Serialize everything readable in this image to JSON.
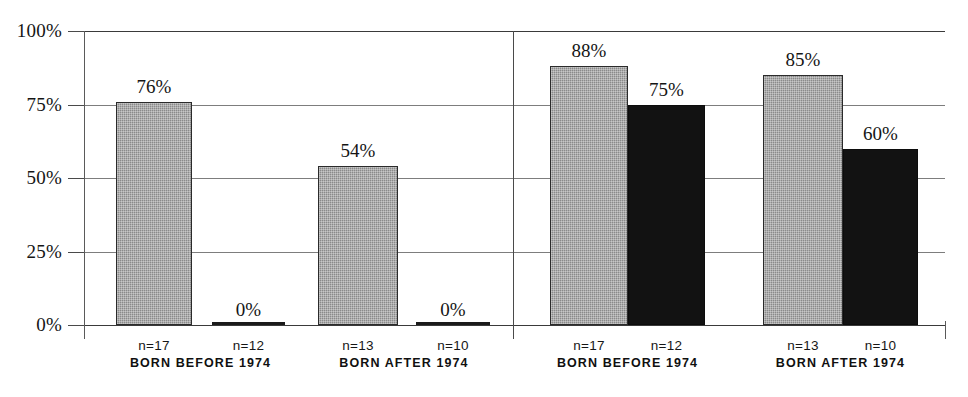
{
  "chart_data": {
    "type": "bar",
    "title": "",
    "subtitle": "",
    "xlabel": "",
    "ylabel": "",
    "ylim": [
      0,
      100
    ],
    "grid": true,
    "legend": "none",
    "y_ticks": [
      {
        "value": 100,
        "label": "100%"
      },
      {
        "value": 75,
        "label": "75%"
      },
      {
        "value": 50,
        "label": "50%"
      },
      {
        "value": 25,
        "label": "25%"
      },
      {
        "value": 0,
        "label": "0%"
      }
    ],
    "panels": [
      {
        "name": "left-panel",
        "groups": [
          {
            "label": "BORN BEFORE 1974",
            "bars": [
              {
                "series": "gray",
                "value": 76,
                "value_label": "76%",
                "n_label": "n=17"
              },
              {
                "series": "black",
                "value": 0,
                "value_label": "0%",
                "n_label": "n=12"
              }
            ]
          },
          {
            "label": "BORN AFTER 1974",
            "bars": [
              {
                "series": "gray",
                "value": 54,
                "value_label": "54%",
                "n_label": "n=13"
              },
              {
                "series": "black",
                "value": 0,
                "value_label": "0%",
                "n_label": "n=10"
              }
            ]
          }
        ]
      },
      {
        "name": "right-panel",
        "groups": [
          {
            "label": "BORN BEFORE 1974",
            "bars": [
              {
                "series": "gray",
                "value": 88,
                "value_label": "88%",
                "n_label": "n=17"
              },
              {
                "series": "black",
                "value": 75,
                "value_label": "75%",
                "n_label": "n=12"
              }
            ]
          },
          {
            "label": "BORN AFTER 1974",
            "bars": [
              {
                "series": "gray",
                "value": 85,
                "value_label": "85%",
                "n_label": "n=13"
              },
              {
                "series": "black",
                "value": 60,
                "value_label": "60%",
                "n_label": "n=10"
              }
            ]
          }
        ]
      }
    ],
    "colors": {
      "gray_series": "#8a8a8a",
      "black_series": "#121212",
      "gridline": "#7d7d7d",
      "axis": "#3a3a3a",
      "text": "#151515",
      "background": "#ffffff"
    }
  }
}
